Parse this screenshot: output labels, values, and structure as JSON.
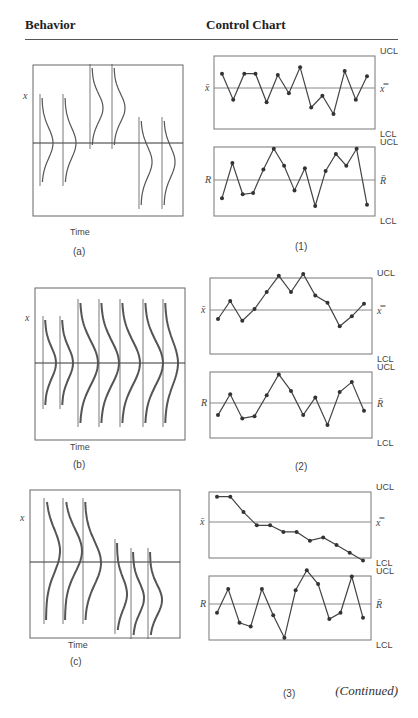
{
  "headers": {
    "behavior": "Behavior",
    "control_chart": "Control Chart"
  },
  "continued": "(Continued)",
  "labels": {
    "time": "Time",
    "x": "x",
    "xbar": "x̄",
    "xbarbar": "x̿",
    "r": "R",
    "rbar": "R̄",
    "ucl": "UCL",
    "lcl": "LCL"
  },
  "rows": [
    {
      "behavior_label": "(a)",
      "chart_label": "(1)"
    },
    {
      "behavior_label": "(b)",
      "chart_label": "(2)"
    },
    {
      "behavior_label": "(c)",
      "chart_label": "(3)"
    }
  ],
  "chart_data": [
    {
      "type": "line",
      "title": "(1) x̄ chart",
      "ylabel": "x̄",
      "limits": [
        "UCL",
        "x̿",
        "LCL"
      ],
      "values": [
        0.55,
        -0.45,
        0.55,
        0.55,
        -0.55,
        0.5,
        -0.2,
        0.8,
        -0.75,
        -0.3,
        -1.0,
        0.65,
        -0.45,
        0.45
      ]
    },
    {
      "type": "line",
      "title": "(1) R chart",
      "ylabel": "R",
      "limits": [
        "UCL",
        "R̄",
        "LCL"
      ],
      "values": [
        -0.7,
        0.65,
        -0.55,
        -0.5,
        0.4,
        1.2,
        0.55,
        -0.4,
        0.45,
        -1.0,
        0.35,
        1.0,
        0.55,
        1.2,
        -0.95
      ]
    },
    {
      "type": "line",
      "title": "(2) x̄ chart",
      "ylabel": "x̄",
      "limits": [
        "UCL",
        "x̿",
        "LCL"
      ],
      "values": [
        -0.5,
        0.5,
        -0.6,
        0.05,
        1.0,
        1.9,
        1.0,
        2.0,
        0.8,
        0.4,
        -0.9,
        -0.35,
        0.35
      ]
    },
    {
      "type": "line",
      "title": "(2) R chart",
      "ylabel": "R",
      "limits": [
        "UCL",
        "R̄",
        "LCL"
      ],
      "values": [
        -0.55,
        0.4,
        -0.7,
        -0.6,
        0.35,
        1.3,
        0.55,
        -0.55,
        0.25,
        -1.0,
        0.5,
        0.95,
        -0.35
      ]
    },
    {
      "type": "line",
      "title": "(3) x̄ chart",
      "ylabel": "x̄",
      "limits": [
        "UCL",
        "x̿",
        "LCL"
      ],
      "values": [
        1.15,
        1.15,
        0.45,
        -0.15,
        -0.15,
        -0.45,
        -0.45,
        -0.85,
        -0.7,
        -1.05,
        -1.4,
        -1.75
      ]
    },
    {
      "type": "line",
      "title": "(3) R chart",
      "ylabel": "R",
      "limits": [
        "UCL",
        "R̄",
        "LCL"
      ],
      "values": [
        -0.35,
        0.6,
        -0.75,
        -0.9,
        0.6,
        -0.45,
        -1.35,
        0.55,
        1.35,
        0.8,
        -0.6,
        -0.35,
        1.1,
        -0.55
      ]
    }
  ]
}
